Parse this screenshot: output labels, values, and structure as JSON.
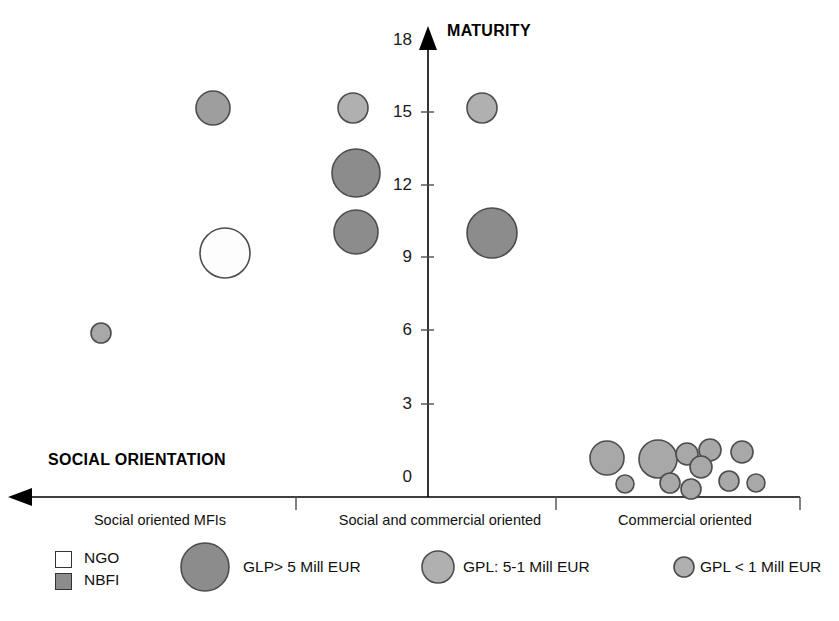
{
  "chart_data": {
    "type": "scatter",
    "title": "",
    "subtitle": "",
    "ylabel": "MATURITY",
    "xlabel": "SOCIAL ORIENTATION",
    "ylim": [
      0,
      18
    ],
    "yticks": [
      0,
      3,
      6,
      9,
      12,
      15,
      18
    ],
    "ytick_labels": [
      "0",
      "3",
      "6",
      "9",
      "12",
      "15",
      "18"
    ],
    "grid": false,
    "legend_position": "bottom",
    "x_axis_direction": "arrow-left",
    "categories": [
      "Social oriented  MFIs",
      "Social and commercial oriented",
      "Commercial oriented"
    ],
    "bubble_size_legend": [
      {
        "key": "large",
        "label": "GLP> 5 Mill EUR",
        "radius": 24,
        "fill": "#8c8c8c"
      },
      {
        "key": "medium",
        "label": "GPL: 5-1 Mill EUR",
        "radius": 16,
        "fill": "#b3b3b3"
      },
      {
        "key": "small",
        "label": "GPL < 1 Mill EUR",
        "radius": 10,
        "fill": "#b3b3b3"
      }
    ],
    "type_legend": [
      {
        "key": "ngo",
        "label": "NGO",
        "fill": "#ffffff"
      },
      {
        "key": "nbfi",
        "label": "NBFI",
        "fill": "#8c8c8c"
      }
    ],
    "points": [
      {
        "id": "p1",
        "category": "Social oriented  MFIs",
        "cx": 213,
        "cy": 108,
        "r": 17,
        "maturity": 15.6,
        "size_class": "medium",
        "org_type": "NBFI",
        "fill": "#9e9e9e"
      },
      {
        "id": "p2",
        "category": "Social oriented  MFIs",
        "cx": 225,
        "cy": 253,
        "r": 25,
        "maturity": 9.9,
        "size_class": "large",
        "org_type": "NGO",
        "fill": "#fdfdfd"
      },
      {
        "id": "p3",
        "category": "Social oriented  MFIs",
        "cx": 101,
        "cy": 333,
        "r": 10,
        "maturity": 6.7,
        "size_class": "small",
        "org_type": "NBFI",
        "fill": "#a8a8a8"
      },
      {
        "id": "p4",
        "category": "Social and commercial oriented",
        "cx": 353,
        "cy": 108,
        "r": 15,
        "maturity": 15.6,
        "size_class": "medium",
        "org_type": "NBFI",
        "fill": "#b0b0b0"
      },
      {
        "id": "p5",
        "category": "Social and commercial oriented",
        "cx": 356,
        "cy": 173,
        "r": 24,
        "maturity": 13.0,
        "size_class": "large",
        "org_type": "NBFI",
        "fill": "#8c8c8c"
      },
      {
        "id": "p6",
        "category": "Social and commercial oriented",
        "cx": 356,
        "cy": 232,
        "r": 22,
        "maturity": 10.6,
        "size_class": "large",
        "org_type": "NBFI",
        "fill": "#8c8c8c"
      },
      {
        "id": "p7",
        "category": "Social and commercial oriented",
        "cx": 482,
        "cy": 108,
        "r": 15,
        "maturity": 15.6,
        "size_class": "medium",
        "org_type": "NBFI",
        "fill": "#b0b0b0"
      },
      {
        "id": "p8",
        "category": "Social and commercial oriented",
        "cx": 492,
        "cy": 233,
        "r": 25,
        "maturity": 10.6,
        "size_class": "large",
        "org_type": "NBFI",
        "fill": "#8c8c8c"
      },
      {
        "id": "p9",
        "category": "Commercial oriented",
        "cx": 607,
        "cy": 458,
        "r": 17,
        "maturity": 1.4,
        "size_class": "medium",
        "org_type": "NBFI",
        "fill": "#a8a8a8"
      },
      {
        "id": "p10",
        "category": "Commercial oriented",
        "cx": 625,
        "cy": 484,
        "r": 9,
        "maturity": 0.3,
        "size_class": "small",
        "org_type": "NBFI",
        "fill": "#a8a8a8"
      },
      {
        "id": "p11",
        "category": "Commercial oriented",
        "cx": 658,
        "cy": 459,
        "r": 19,
        "maturity": 1.4,
        "size_class": "medium",
        "org_type": "NBFI",
        "fill": "#a8a8a8"
      },
      {
        "id": "p12",
        "category": "Commercial oriented",
        "cx": 687,
        "cy": 454,
        "r": 11,
        "maturity": 1.6,
        "size_class": "small",
        "org_type": "NBFI",
        "fill": "#a8a8a8"
      },
      {
        "id": "p13",
        "category": "Commercial oriented",
        "cx": 710,
        "cy": 450,
        "r": 11,
        "maturity": 1.8,
        "size_class": "small",
        "org_type": "NBFI",
        "fill": "#a8a8a8"
      },
      {
        "id": "p14",
        "category": "Commercial oriented",
        "cx": 701,
        "cy": 467,
        "r": 11,
        "maturity": 1.1,
        "size_class": "small",
        "org_type": "NBFI",
        "fill": "#a8a8a8"
      },
      {
        "id": "p15",
        "category": "Commercial oriented",
        "cx": 670,
        "cy": 483,
        "r": 10,
        "maturity": 0.4,
        "size_class": "small",
        "org_type": "NBFI",
        "fill": "#a8a8a8"
      },
      {
        "id": "p16",
        "category": "Commercial oriented",
        "cx": 691,
        "cy": 489,
        "r": 10,
        "maturity": 0.1,
        "size_class": "small",
        "org_type": "NBFI",
        "fill": "#a8a8a8"
      },
      {
        "id": "p17",
        "category": "Commercial oriented",
        "cx": 729,
        "cy": 481,
        "r": 10,
        "maturity": 0.5,
        "size_class": "small",
        "org_type": "NBFI",
        "fill": "#a8a8a8"
      },
      {
        "id": "p18",
        "category": "Commercial oriented",
        "cx": 742,
        "cy": 452,
        "r": 11,
        "maturity": 1.8,
        "size_class": "small",
        "org_type": "NBFI",
        "fill": "#a8a8a8"
      },
      {
        "id": "p19",
        "category": "Commercial oriented",
        "cx": 756,
        "cy": 483,
        "r": 9,
        "maturity": 0.3,
        "size_class": "small",
        "org_type": "NBFI",
        "fill": "#a8a8a8"
      }
    ]
  },
  "axes": {
    "y_title": "MATURITY",
    "x_title": "SOCIAL ORIENTATION",
    "zero_label": "0",
    "ticks": [
      {
        "value": "18",
        "y": 40
      },
      {
        "value": "15",
        "y": 112
      },
      {
        "value": "12",
        "y": 185
      },
      {
        "value": "9",
        "y": 257
      },
      {
        "value": "6",
        "y": 330
      },
      {
        "value": "3",
        "y": 404
      },
      {
        "value": "0",
        "y": 477
      }
    ]
  },
  "category_labels": [
    {
      "text": "Social oriented  MFIs",
      "x": 160,
      "y": 510
    },
    {
      "text": "Social and commercial oriented",
      "x": 440,
      "y": 510
    },
    {
      "text": "Commercial oriented",
      "x": 685,
      "y": 510
    }
  ],
  "legend": {
    "ngo": {
      "label": "NGO",
      "x": 66,
      "y": 550
    },
    "nbfi": {
      "label": "NBFI",
      "x": 66,
      "y": 572
    },
    "large": {
      "label": "GLP> 5 Mill EUR",
      "x": 240,
      "y": 562
    },
    "medium": {
      "label": "GPL: 5-1 Mill EUR",
      "x": 470,
      "y": 562
    },
    "small": {
      "label": "GPL < 1 Mill EUR",
      "x": 696,
      "y": 562
    }
  },
  "colors": {
    "axis": "#000000",
    "bubble_stroke": "#4d4d4d",
    "bubble_fill_dark": "#8c8c8c",
    "bubble_fill_light": "#b0b0b0",
    "bubble_fill_white": "#ffffff",
    "text": "#111111"
  }
}
